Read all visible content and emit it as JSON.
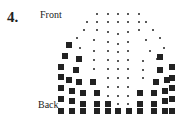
{
  "figure": {
    "number": "4.",
    "label_top": "Front",
    "label_bottom": "Back"
  },
  "legend": {
    "small_dot": "small",
    "large_square": "large"
  },
  "points": {
    "small": [
      [
        97,
        14
      ],
      [
        108,
        14
      ],
      [
        118,
        14
      ],
      [
        128,
        14
      ],
      [
        139,
        14
      ],
      [
        87,
        22
      ],
      [
        97,
        22
      ],
      [
        108,
        22
      ],
      [
        118,
        22
      ],
      [
        128,
        22
      ],
      [
        139,
        22
      ],
      [
        146,
        22
      ],
      [
        84,
        30
      ],
      [
        97,
        30
      ],
      [
        108,
        32
      ],
      [
        118,
        34
      ],
      [
        128,
        32
      ],
      [
        139,
        30
      ],
      [
        153,
        30
      ],
      [
        77,
        38
      ],
      [
        94,
        40
      ],
      [
        108,
        42
      ],
      [
        118,
        44
      ],
      [
        128,
        42
      ],
      [
        146,
        40
      ],
      [
        160,
        38
      ],
      [
        80,
        48
      ],
      [
        94,
        51
      ],
      [
        108,
        51
      ],
      [
        118,
        52
      ],
      [
        128,
        51
      ],
      [
        150,
        51
      ],
      [
        164,
        48
      ],
      [
        94,
        60
      ],
      [
        108,
        60
      ],
      [
        118,
        61
      ],
      [
        128,
        60
      ],
      [
        143,
        61
      ],
      [
        157,
        59
      ],
      [
        94,
        69
      ],
      [
        108,
        69
      ],
      [
        118,
        69
      ],
      [
        128,
        69
      ],
      [
        143,
        70
      ],
      [
        108,
        78
      ],
      [
        118,
        78
      ],
      [
        128,
        78
      ],
      [
        143,
        78
      ],
      [
        108,
        87
      ],
      [
        118,
        87
      ],
      [
        128,
        87
      ],
      [
        108,
        96
      ],
      [
        118,
        96
      ],
      [
        128,
        96
      ],
      [
        118,
        104
      ],
      [
        128,
        104
      ]
    ],
    "large": [
      [
        69,
        45
      ],
      [
        65,
        56
      ],
      [
        79,
        59
      ],
      [
        160,
        57
      ],
      [
        61,
        67
      ],
      [
        76,
        70
      ],
      [
        172,
        67
      ],
      [
        160,
        70
      ],
      [
        61,
        77
      ],
      [
        69,
        80
      ],
      [
        79,
        82
      ],
      [
        93,
        82
      ],
      [
        156,
        82
      ],
      [
        167,
        80
      ],
      [
        172,
        78
      ],
      [
        61,
        88
      ],
      [
        72,
        91
      ],
      [
        83,
        93
      ],
      [
        97,
        93
      ],
      [
        140,
        93
      ],
      [
        154,
        93
      ],
      [
        165,
        91
      ],
      [
        172,
        88
      ],
      [
        61,
        99
      ],
      [
        72,
        101
      ],
      [
        83,
        104
      ],
      [
        97,
        104
      ],
      [
        108,
        104
      ],
      [
        140,
        104
      ],
      [
        154,
        104
      ],
      [
        165,
        101
      ],
      [
        172,
        99
      ],
      [
        61,
        111
      ],
      [
        72,
        111
      ],
      [
        83,
        111
      ],
      [
        97,
        111
      ],
      [
        108,
        111
      ],
      [
        118,
        111
      ],
      [
        129,
        111
      ],
      [
        140,
        111
      ],
      [
        154,
        111
      ],
      [
        165,
        111
      ],
      [
        172,
        111
      ]
    ]
  }
}
